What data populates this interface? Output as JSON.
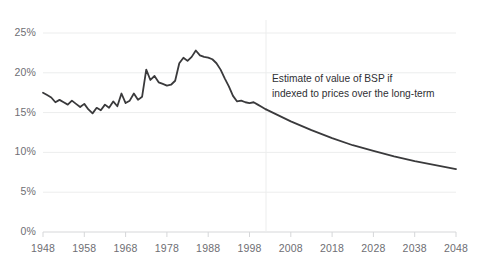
{
  "chart_data": {
    "type": "line",
    "title": "",
    "subtitle": "",
    "xlabel": "",
    "ylabel": "",
    "grid": true,
    "legend": false,
    "xlim": [
      1948,
      2048
    ],
    "ylim": [
      0,
      25
    ],
    "y_tick_labels": [
      "0%",
      "5%",
      "10%",
      "15%",
      "20%",
      "25%"
    ],
    "y_ticks": [
      0,
      5,
      10,
      15,
      20,
      25
    ],
    "x_tick_labels": [
      "1948",
      "1958",
      "1968",
      "1978",
      "1988",
      "1998",
      "2008",
      "2018",
      "2028",
      "2038",
      "2048"
    ],
    "x_ticks": [
      1948,
      1958,
      1968,
      1978,
      1988,
      1998,
      2008,
      2018,
      2028,
      2038,
      2048
    ],
    "annotations": [
      {
        "text": "Estimate of value of BSP if\nindexed to prices over the long-term",
        "x": 2012,
        "y": 18.5
      }
    ],
    "vertical_divider": {
      "x": 2002,
      "label": "forecast-boundary"
    },
    "series": [
      {
        "name": "BSP value as share",
        "color": "#3a3a3c",
        "x": [
          1948,
          1949,
          1950,
          1951,
          1952,
          1953,
          1954,
          1955,
          1956,
          1957,
          1958,
          1959,
          1960,
          1961,
          1962,
          1963,
          1964,
          1965,
          1966,
          1967,
          1968,
          1969,
          1970,
          1971,
          1972,
          1973,
          1974,
          1975,
          1976,
          1977,
          1978,
          1979,
          1980,
          1981,
          1982,
          1983,
          1984,
          1985,
          1986,
          1987,
          1988,
          1989,
          1990,
          1991,
          1992,
          1993,
          1994,
          1995,
          1996,
          1997,
          1998,
          1999,
          2000,
          2001,
          2002
        ],
        "values": [
          17.5,
          17.2,
          16.9,
          16.3,
          16.6,
          16.3,
          16.0,
          16.5,
          16.1,
          15.7,
          16.1,
          15.4,
          14.9,
          15.6,
          15.3,
          16.0,
          15.6,
          16.4,
          15.8,
          17.4,
          16.2,
          16.5,
          17.4,
          16.6,
          17.0,
          20.4,
          19.1,
          19.6,
          18.8,
          18.6,
          18.4,
          18.5,
          19.0,
          21.2,
          21.9,
          21.5,
          22.0,
          22.8,
          22.2,
          22.0,
          21.9,
          21.7,
          21.2,
          20.4,
          19.3,
          18.3,
          17.1,
          16.4,
          16.5,
          16.3,
          16.2,
          16.3,
          16.0,
          15.7,
          15.4
        ],
        "style": "historical"
      },
      {
        "name": "Estimate of value of BSP if indexed to prices over the long-term",
        "color": "#3a3a3c",
        "x": [
          2002,
          2008,
          2013,
          2018,
          2023,
          2028,
          2033,
          2038,
          2043,
          2048
        ],
        "values": [
          15.4,
          13.9,
          12.8,
          11.8,
          10.9,
          10.2,
          9.5,
          8.9,
          8.4,
          7.9
        ],
        "style": "projection"
      }
    ]
  },
  "style": {
    "background": "#ffffff",
    "grid_color": "#eceded",
    "axis_color": "#d6d7d9",
    "line_color": "#3a3a3c",
    "tick_text_color": "#6e6e73",
    "annotation_color": "#2f2f33"
  }
}
